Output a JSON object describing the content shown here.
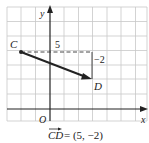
{
  "diagram": {
    "axes": {
      "x_label": "x",
      "y_label": "y",
      "origin_label": "O"
    },
    "points": [
      {
        "name": "C",
        "grid": [
          -2,
          4
        ]
      },
      {
        "name": "D",
        "grid": [
          3,
          2
        ]
      }
    ],
    "components": {
      "horizontal_label": "5",
      "vertical_label": "−2"
    },
    "caption": {
      "vector": "CD",
      "equals": "= (5, −2)"
    },
    "colors": {
      "grid": "#c8c8c8",
      "axis": "#222222",
      "vector": "#222222",
      "dashed": "#333333"
    }
  }
}
